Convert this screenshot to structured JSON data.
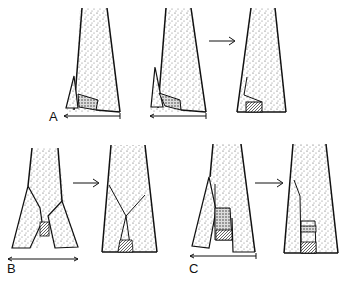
{
  "figure": {
    "panels": [
      {
        "id": "A",
        "label": "A",
        "steps": 3,
        "description": "Wedge bone flap with graft, sequential stages"
      },
      {
        "id": "B",
        "label": "B",
        "steps": 2,
        "description": "Split bilateral flaps with graft"
      },
      {
        "id": "C",
        "label": "C",
        "steps": 2,
        "description": "Lateral flap with interposed graft"
      }
    ],
    "arrow_glyph": "→",
    "colors": {
      "ink": "#111111",
      "background": "#ffffff",
      "stipple": "#555555"
    }
  }
}
